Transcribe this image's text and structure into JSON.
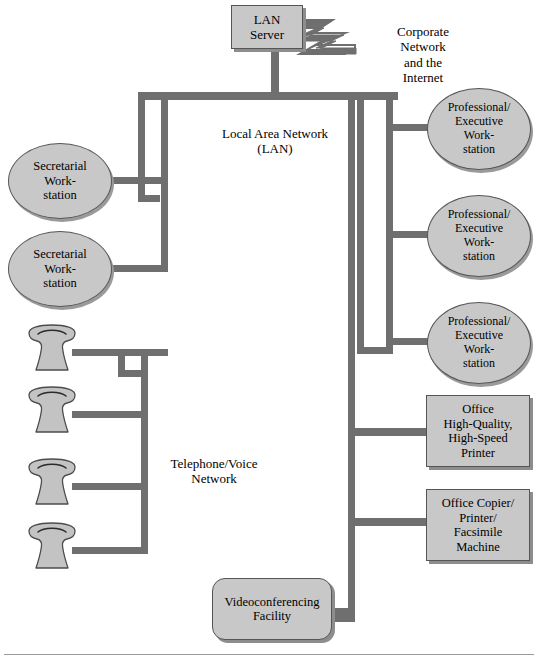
{
  "diagram": {
    "type": "network-topology",
    "colors": {
      "node_fill": "#c8c8c8",
      "node_border": "#555555",
      "bus_line": "#6f6f6f",
      "shadow": "#8d8d8d",
      "background": "#ffffff",
      "text": "#000000"
    },
    "nodes": {
      "lan_server": {
        "label": "LAN\nServer",
        "shape": "rectangle"
      },
      "corporate_network": {
        "label": "Corporate\nNetwork\nand the\nInternet",
        "shape": "text"
      },
      "lan_label": {
        "label": "Local Area Network\n(LAN)",
        "shape": "text"
      },
      "telephone_network_label": {
        "label": "Telephone/Voice\nNetwork",
        "shape": "text"
      },
      "secretarial_1": {
        "label": "Secretarial\nWork-\nstation",
        "shape": "oval"
      },
      "secretarial_2": {
        "label": "Secretarial\nWork-\nstation",
        "shape": "oval"
      },
      "professional_1": {
        "label": "Professional/\nExecutive\nWork-\nstation",
        "shape": "oval"
      },
      "professional_2": {
        "label": "Professional/\nExecutive\nWork-\nstation",
        "shape": "oval"
      },
      "professional_3": {
        "label": "Professional/\nExecutive\nWork-\nstation",
        "shape": "oval"
      },
      "printer": {
        "label": "Office\nHigh-Quality,\nHigh-Speed\nPrinter",
        "shape": "rectangle"
      },
      "copier": {
        "label": "Office Copier/\nPrinter/\nFacsimile\nMachine",
        "shape": "rectangle"
      },
      "videoconferencing": {
        "label": "Videoconferencing\nFacility",
        "shape": "rounded-rectangle"
      },
      "telephone_1": {
        "label": "",
        "shape": "telephone-icon"
      },
      "telephone_2": {
        "label": "",
        "shape": "telephone-icon"
      },
      "telephone_3": {
        "label": "",
        "shape": "telephone-icon"
      },
      "telephone_4": {
        "label": "",
        "shape": "telephone-icon"
      }
    },
    "connections": [
      {
        "from": "lan_server",
        "to": "corporate_network",
        "style": "lightning"
      },
      {
        "from": "lan_server",
        "to": "lan_bus",
        "style": "line"
      },
      {
        "from": "secretarial_1",
        "to": "lan_bus_left",
        "style": "line"
      },
      {
        "from": "secretarial_2",
        "to": "lan_bus_left",
        "style": "line"
      },
      {
        "from": "professional_1",
        "to": "lan_bus_right",
        "style": "line"
      },
      {
        "from": "professional_2",
        "to": "lan_bus_right",
        "style": "line"
      },
      {
        "from": "professional_3",
        "to": "lan_bus_right",
        "style": "line"
      },
      {
        "from": "printer",
        "to": "lan_bus_outer",
        "style": "line"
      },
      {
        "from": "copier",
        "to": "lan_bus_outer",
        "style": "line"
      },
      {
        "from": "videoconferencing",
        "to": "lan_bus_outer",
        "style": "line"
      },
      {
        "from": "telephone_1",
        "to": "voice_bus",
        "style": "line"
      },
      {
        "from": "telephone_2",
        "to": "voice_bus",
        "style": "line"
      },
      {
        "from": "telephone_3",
        "to": "voice_bus",
        "style": "line"
      },
      {
        "from": "telephone_4",
        "to": "voice_bus",
        "style": "line"
      }
    ]
  }
}
